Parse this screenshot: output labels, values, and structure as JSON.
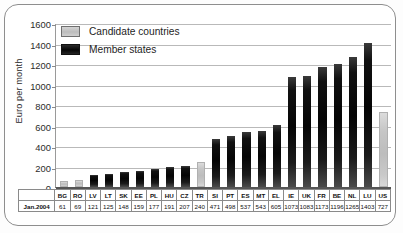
{
  "chart_data": {
    "type": "bar",
    "title": "",
    "subtitle": "",
    "xlabel": "",
    "ylabel": "Euro per month",
    "ylim": [
      0,
      1600
    ],
    "ytick_step": 200,
    "yticks": [
      1600,
      1400,
      1200,
      1000,
      800,
      600,
      400,
      200,
      0
    ],
    "grid": true,
    "legend_position": "top-left inside plot",
    "legend": [
      {
        "label": "Candidate countries",
        "color": "#c6c6c6"
      },
      {
        "label": "Member states",
        "color": "#0a0a0a"
      }
    ],
    "categories": [
      "BG",
      "RO",
      "LV",
      "LT",
      "SK",
      "EE",
      "PL",
      "HU",
      "CZ",
      "TR",
      "SI",
      "PT",
      "ES",
      "MT",
      "EL",
      "IE",
      "UK",
      "FR",
      "BE",
      "NL",
      "LU",
      "US"
    ],
    "values": [
      61,
      69,
      121,
      125,
      148,
      159,
      177,
      191,
      207,
      240,
      471,
      498,
      537,
      543,
      605,
      1073,
      1083,
      1173,
      1196,
      1265,
      1403,
      727
    ],
    "groups": [
      "candidate",
      "candidate",
      "member",
      "member",
      "member",
      "member",
      "member",
      "member",
      "member",
      "candidate",
      "member",
      "member",
      "member",
      "member",
      "member",
      "member",
      "member",
      "member",
      "member",
      "member",
      "member",
      "candidate"
    ],
    "bars": [
      {
        "code": "BG",
        "value": 61,
        "group": "candidate"
      },
      {
        "code": "RO",
        "value": 69,
        "group": "candidate"
      },
      {
        "code": "LV",
        "value": 121,
        "group": "member"
      },
      {
        "code": "LT",
        "value": 125,
        "group": "member"
      },
      {
        "code": "SK",
        "value": 148,
        "group": "member"
      },
      {
        "code": "EE",
        "value": 159,
        "group": "member"
      },
      {
        "code": "PL",
        "value": 177,
        "group": "member"
      },
      {
        "code": "HU",
        "value": 191,
        "group": "member"
      },
      {
        "code": "CZ",
        "value": 207,
        "group": "member"
      },
      {
        "code": "TR",
        "value": 240,
        "group": "candidate"
      },
      {
        "code": "SI",
        "value": 471,
        "group": "member"
      },
      {
        "code": "PT",
        "value": 498,
        "group": "member"
      },
      {
        "code": "ES",
        "value": 537,
        "group": "member"
      },
      {
        "code": "MT",
        "value": 543,
        "group": "member"
      },
      {
        "code": "EL",
        "value": 605,
        "group": "member"
      },
      {
        "code": "IE",
        "value": 1073,
        "group": "member"
      },
      {
        "code": "UK",
        "value": 1083,
        "group": "member"
      },
      {
        "code": "FR",
        "value": 1173,
        "group": "member"
      },
      {
        "code": "BE",
        "value": 1196,
        "group": "member"
      },
      {
        "code": "NL",
        "value": 1265,
        "group": "member"
      },
      {
        "code": "LU",
        "value": 1403,
        "group": "member"
      },
      {
        "code": "US",
        "value": 727,
        "group": "candidate"
      }
    ],
    "table": {
      "value_row_label": "Jan.2004",
      "code_row": [
        "BG",
        "RO",
        "LV",
        "LT",
        "SK",
        "EE",
        "PL",
        "HU",
        "CZ",
        "TR",
        "SI",
        "PT",
        "ES",
        "MT",
        "EL",
        "IE",
        "UK",
        "FR",
        "BE",
        "NL",
        "LU",
        "US"
      ],
      "value_row": [
        "61",
        "69",
        "121",
        "125",
        "148",
        "159",
        "177",
        "191",
        "207",
        "240",
        "471",
        "498",
        "537",
        "543",
        "605",
        "1073",
        "1083",
        "1173",
        "1196",
        "1265",
        "1403",
        "727"
      ]
    }
  },
  "colors": {
    "candidate": "#c6c6c6",
    "member": "#0a0a0a",
    "grid": "#b9b9b9",
    "axis": "#555555",
    "frame": "#8e8e8e",
    "background": "#ffffff"
  }
}
